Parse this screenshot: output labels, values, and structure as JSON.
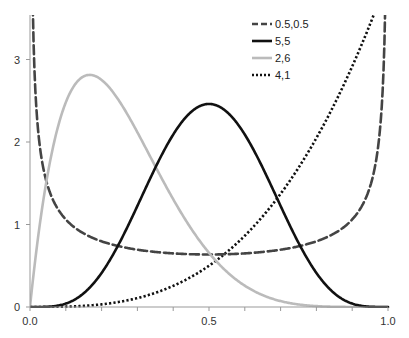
{
  "chart_data": {
    "type": "line",
    "title": "",
    "xlabel": "",
    "ylabel": "",
    "xlim": [
      0.0,
      1.0
    ],
    "ylim": [
      0,
      3.5
    ],
    "grid": false,
    "legend_position": "top-right",
    "x_ticks": [
      {
        "value": 0.0,
        "label": "0.0"
      },
      {
        "value": 0.1,
        "label": ""
      },
      {
        "value": 0.2,
        "label": ""
      },
      {
        "value": 0.3,
        "label": ""
      },
      {
        "value": 0.4,
        "label": ""
      },
      {
        "value": 0.5,
        "label": "0.5"
      },
      {
        "value": 0.6,
        "label": ""
      },
      {
        "value": 0.7,
        "label": ""
      },
      {
        "value": 0.8,
        "label": ""
      },
      {
        "value": 0.9,
        "label": ""
      },
      {
        "value": 1.0,
        "label": "1.0"
      }
    ],
    "y_ticks": [
      {
        "value": 0,
        "label": "0"
      },
      {
        "value": 1,
        "label": "1"
      },
      {
        "value": 2,
        "label": "2"
      },
      {
        "value": 3,
        "label": "3"
      }
    ],
    "series": [
      {
        "name": "0.5,0.5",
        "alpha": 0.5,
        "beta": 0.5,
        "style": "dashed",
        "color": "#444444",
        "width": 2.6,
        "x": [
          0.01,
          0.05,
          0.1,
          0.2,
          0.3,
          0.4,
          0.5,
          0.6,
          0.7,
          0.8,
          0.9,
          0.95,
          0.99
        ],
        "values": [
          3.2,
          1.46,
          1.06,
          0.8,
          0.69,
          0.65,
          0.64,
          0.65,
          0.69,
          0.8,
          1.06,
          1.46,
          3.2
        ]
      },
      {
        "name": "5,5",
        "alpha": 5,
        "beta": 5,
        "style": "solid",
        "color": "#111111",
        "width": 2.6,
        "x": [
          0.0,
          0.1,
          0.2,
          0.3,
          0.4,
          0.5,
          0.6,
          0.7,
          0.8,
          0.9,
          1.0
        ],
        "values": [
          0,
          0.04,
          0.42,
          1.32,
          2.15,
          2.46,
          2.15,
          1.32,
          0.42,
          0.04,
          0
        ]
      },
      {
        "name": "2,6",
        "alpha": 2,
        "beta": 6,
        "style": "solid",
        "color": "#bbbbbb",
        "width": 2.6,
        "x": [
          0.0,
          0.05,
          0.1,
          0.167,
          0.2,
          0.3,
          0.4,
          0.5,
          0.6,
          0.7,
          0.8,
          0.9,
          1.0
        ],
        "values": [
          0,
          2.16,
          2.48,
          2.83,
          2.75,
          2.12,
          1.3,
          0.66,
          0.27,
          0.08,
          0.01,
          0.0,
          0
        ]
      },
      {
        "name": "4,1",
        "alpha": 4,
        "beta": 1,
        "style": "dotted",
        "color": "#111111",
        "width": 2.6,
        "x": [
          0.0,
          0.1,
          0.2,
          0.3,
          0.4,
          0.5,
          0.6,
          0.7,
          0.8,
          0.9,
          0.95
        ],
        "values": [
          0,
          0.004,
          0.03,
          0.11,
          0.26,
          0.5,
          0.86,
          1.37,
          2.05,
          2.92,
          3.43
        ]
      }
    ]
  },
  "legend": {
    "items": [
      {
        "label": "0.5,0.5"
      },
      {
        "label": "5,5"
      },
      {
        "label": "2,6"
      },
      {
        "label": "4,1"
      }
    ]
  },
  "axes": {
    "x_labels": [
      "0.0",
      "0.5",
      "1.0"
    ],
    "y_labels": [
      "0",
      "1",
      "2",
      "3"
    ]
  }
}
